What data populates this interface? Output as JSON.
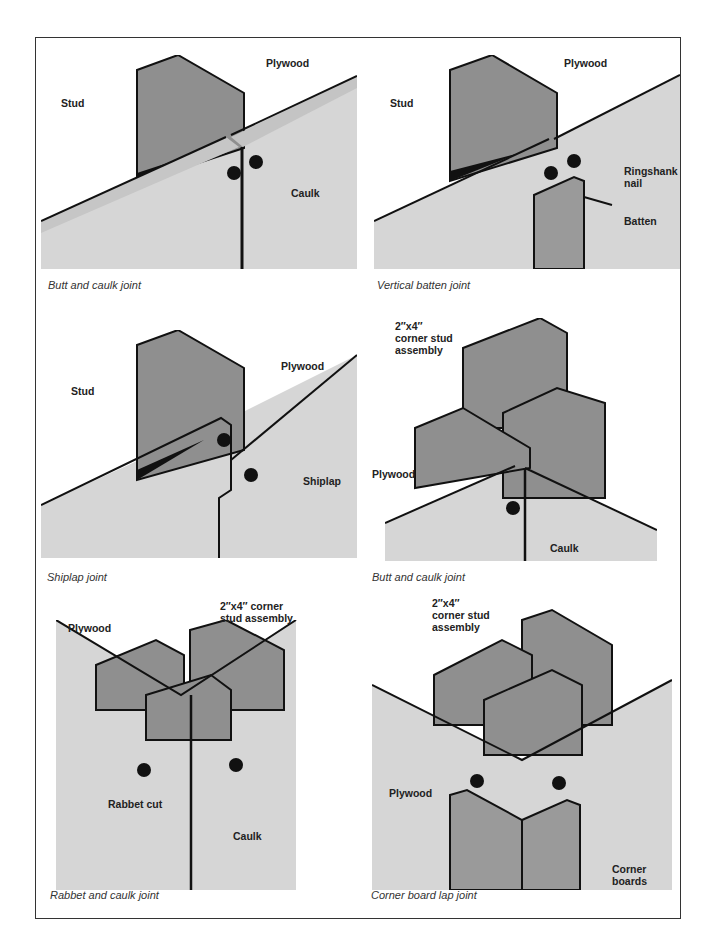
{
  "colors": {
    "stud": "#8f8f8f",
    "stud_dark": "#7a7a7a",
    "plywood": "#d6d6d6",
    "edge": "#c4c4c4",
    "outline": "#111111",
    "batten": "#9a9a9a"
  },
  "panels": [
    {
      "caption": "Butt and caulk joint",
      "labels": {
        "stud": "Stud",
        "plywood": "Plywood",
        "caulk": "Caulk"
      }
    },
    {
      "caption": "Vertical batten joint",
      "labels": {
        "stud": "Stud",
        "plywood": "Plywood",
        "nail_1": "Ringshank",
        "nail_2": "nail",
        "batten": "Batten"
      }
    },
    {
      "caption": "Shiplap joint",
      "labels": {
        "stud": "Stud",
        "plywood": "Plywood",
        "shiplap": "Shiplap"
      }
    },
    {
      "caption": "Butt and caulk joint",
      "labels": {
        "stud_1": "2″x4″",
        "stud_2": "corner stud",
        "stud_3": "assembly",
        "plywood": "Plywood",
        "caulk": "Caulk"
      }
    },
    {
      "caption": "Rabbet and caulk joint",
      "labels": {
        "stud_1": "2″x4″ corner",
        "stud_2": "stud assembly",
        "plywood": "Plywood",
        "rabbet": "Rabbet cut",
        "caulk": "Caulk"
      }
    },
    {
      "caption": "Corner board lap joint",
      "labels": {
        "stud_1": "2″x4″",
        "stud_2": "corner stud",
        "stud_3": "assembly",
        "plywood": "Plywood",
        "corner_1": "Corner",
        "corner_2": "boards"
      }
    }
  ]
}
